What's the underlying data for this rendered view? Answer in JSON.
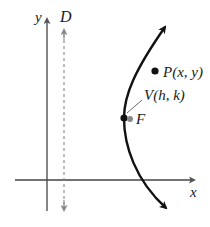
{
  "diagram": {
    "type": "parabola-definition",
    "axes": {
      "x_label": "x",
      "y_label": "y"
    },
    "directrix": {
      "label": "D",
      "style": "dashed",
      "color": "#888888"
    },
    "curve": {
      "description": "parabola opening right",
      "color": "#111111"
    },
    "points": [
      {
        "id": "P",
        "label": "P(x, y)",
        "color": "#111111"
      },
      {
        "id": "V",
        "label": "V(h, k)",
        "color": "#111111"
      },
      {
        "id": "F",
        "label": "F",
        "color": "#888888"
      }
    ]
  }
}
